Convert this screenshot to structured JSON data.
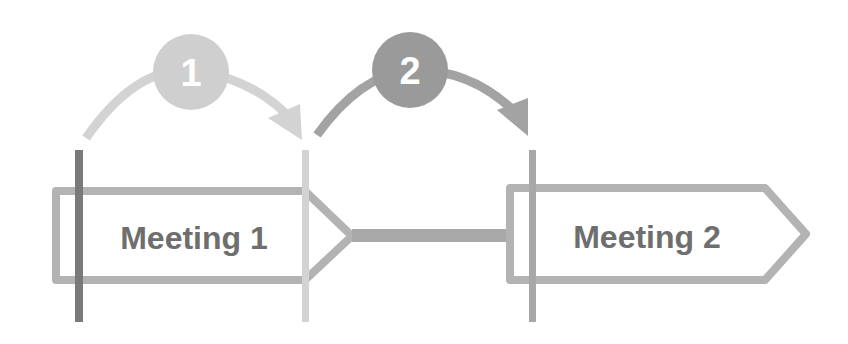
{
  "diagram": {
    "title": "",
    "steps": [
      {
        "number": "1",
        "color": "#cfcfcf"
      },
      {
        "number": "2",
        "color": "#9a9a9a"
      }
    ],
    "meetings": [
      {
        "label": "Meeting 1"
      },
      {
        "label": "Meeting 2"
      }
    ],
    "colors": {
      "box_stroke": "#b3b3b3",
      "text": "#6e6e6e",
      "marker_dark": "#7a7a7a",
      "marker_light": "#d3d3d3",
      "marker_mid": "#a8a8a8",
      "connector": "#a8a8a8",
      "arrow1": "#d3d3d3",
      "arrow2": "#a3a3a3"
    }
  }
}
